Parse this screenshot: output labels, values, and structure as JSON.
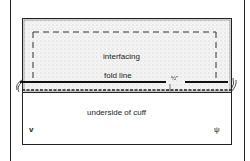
{
  "diagram": {
    "labels": {
      "interfacing": "interfacing",
      "fold_line": "fold line",
      "measurement": "½\"",
      "underside": "underside of cuff",
      "left_mark": "v",
      "right_mark": "ψ"
    },
    "colors": {
      "line": "#222222",
      "shading": "#e8e8e8",
      "background": "#ffffff"
    }
  }
}
